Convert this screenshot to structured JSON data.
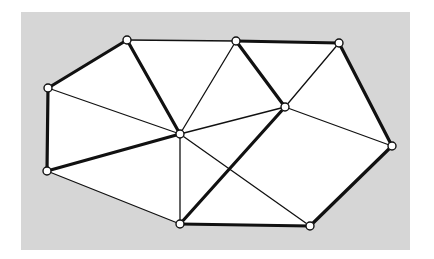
{
  "diagram": {
    "type": "planar-graph-triangulation",
    "background": {
      "x": 21,
      "y": 12,
      "width": 389,
      "height": 238,
      "color": "#d6d6d6",
      "page_color": "#ffffff"
    },
    "colors": {
      "edge": "#111111",
      "node_fill": "#ffffff",
      "node_stroke": "#111111",
      "interior": "#ffffff"
    },
    "nodes": [
      {
        "id": "A",
        "x": 127,
        "y": 40
      },
      {
        "id": "B",
        "x": 236,
        "y": 41
      },
      {
        "id": "C",
        "x": 339,
        "y": 43
      },
      {
        "id": "D",
        "x": 48,
        "y": 88
      },
      {
        "id": "E",
        "x": 180,
        "y": 134
      },
      {
        "id": "F",
        "x": 285,
        "y": 107
      },
      {
        "id": "G",
        "x": 392,
        "y": 146
      },
      {
        "id": "H",
        "x": 47,
        "y": 171
      },
      {
        "id": "I",
        "x": 180,
        "y": 224
      },
      {
        "id": "J",
        "x": 310,
        "y": 226
      }
    ],
    "hull": [
      "A",
      "B",
      "C",
      "G",
      "J",
      "I",
      "H",
      "D"
    ],
    "edges": [
      {
        "from": "A",
        "to": "B",
        "bold": false
      },
      {
        "from": "B",
        "to": "C",
        "bold": true
      },
      {
        "from": "C",
        "to": "G",
        "bold": true
      },
      {
        "from": "G",
        "to": "J",
        "bold": true
      },
      {
        "from": "J",
        "to": "I",
        "bold": true
      },
      {
        "from": "I",
        "to": "H",
        "bold": false
      },
      {
        "from": "H",
        "to": "D",
        "bold": true
      },
      {
        "from": "D",
        "to": "A",
        "bold": true
      },
      {
        "from": "A",
        "to": "E",
        "bold": true
      },
      {
        "from": "B",
        "to": "E",
        "bold": false
      },
      {
        "from": "B",
        "to": "F",
        "bold": true
      },
      {
        "from": "C",
        "to": "F",
        "bold": false
      },
      {
        "from": "D",
        "to": "E",
        "bold": false
      },
      {
        "from": "H",
        "to": "E",
        "bold": true
      },
      {
        "from": "E",
        "to": "F",
        "bold": false
      },
      {
        "from": "E",
        "to": "I",
        "bold": false
      },
      {
        "from": "E",
        "to": "J",
        "bold": false
      },
      {
        "from": "F",
        "to": "I",
        "bold": true
      },
      {
        "from": "F",
        "to": "G",
        "bold": false
      }
    ],
    "stroke": {
      "thin": 1.3,
      "bold": 3.2,
      "node_radius": 4
    }
  }
}
